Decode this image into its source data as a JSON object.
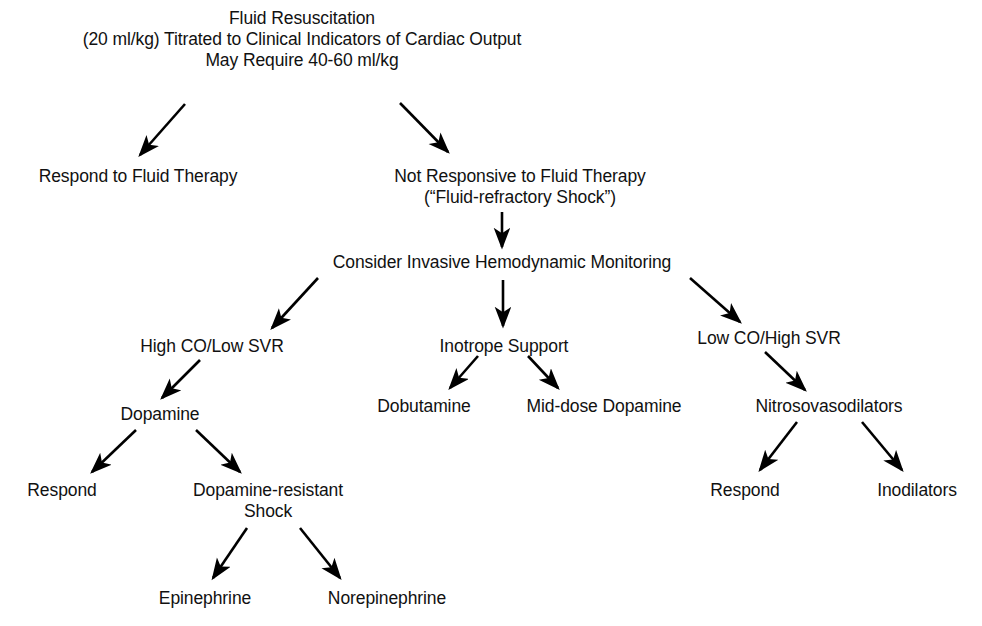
{
  "diagram": {
    "type": "flowchart",
    "orientation": "top-down",
    "background_color": "#ffffff",
    "text_color": "#111111",
    "arrow_color": "#000000",
    "nodes": [
      {
        "id": "fluid-resuscitation",
        "level": 1,
        "lines": [
          "Fluid Resuscitation",
          "(20 ml/kg) Titrated to Clinical Indicators of Cardiac Output",
          "May Require 40-60 ml/kg"
        ],
        "x": 302,
        "y": 8
      },
      {
        "id": "respond-to-fluid-therapy",
        "level": 2,
        "lines": [
          "Respond to Fluid Therapy"
        ],
        "x": 138,
        "y": 166
      },
      {
        "id": "not-responsive-to-fluid-therapy",
        "level": 2,
        "lines": [
          "Not Responsive to Fluid Therapy",
          "(“Fluid-refractory Shock”)"
        ],
        "x": 520,
        "y": 166
      },
      {
        "id": "consider-invasive-hemodynamic-monitoring",
        "level": 3,
        "lines": [
          "Consider Invasive Hemodynamic Monitoring"
        ],
        "x": 502,
        "y": 252
      },
      {
        "id": "high-co-low-svr",
        "level": 4,
        "lines": [
          "High CO/Low SVR"
        ],
        "x": 212,
        "y": 336
      },
      {
        "id": "inotrope-support",
        "level": 4,
        "lines": [
          "Inotrope Support"
        ],
        "x": 504,
        "y": 336
      },
      {
        "id": "low-co-high-svr",
        "level": 4,
        "lines": [
          "Low CO/High SVR"
        ],
        "x": 769,
        "y": 328
      },
      {
        "id": "dopamine",
        "level": 5,
        "lines": [
          "Dopamine"
        ],
        "x": 160,
        "y": 404
      },
      {
        "id": "dobutamine",
        "level": 5,
        "lines": [
          "Dobutamine"
        ],
        "x": 424,
        "y": 396
      },
      {
        "id": "mid-dose-dopamine",
        "level": 5,
        "lines": [
          "Mid-dose Dopamine"
        ],
        "x": 604,
        "y": 396
      },
      {
        "id": "nitrosovasodilators",
        "level": 5,
        "lines": [
          "Nitrosovasodilators"
        ],
        "x": 829,
        "y": 396
      },
      {
        "id": "respond-dopamine",
        "level": 6,
        "lines": [
          "Respond"
        ],
        "x": 62,
        "y": 480
      },
      {
        "id": "dopamine-resistant-shock",
        "level": 6,
        "lines": [
          "Dopamine-resistant",
          "Shock"
        ],
        "x": 268,
        "y": 480
      },
      {
        "id": "respond-nitroso",
        "level": 6,
        "lines": [
          "Respond"
        ],
        "x": 745,
        "y": 480
      },
      {
        "id": "inodilators",
        "level": 6,
        "lines": [
          "Inodilators"
        ],
        "x": 917,
        "y": 480
      },
      {
        "id": "epinephrine",
        "level": 7,
        "lines": [
          "Epinephrine"
        ],
        "x": 205,
        "y": 588
      },
      {
        "id": "norepinephrine",
        "level": 7,
        "lines": [
          "Norepinephrine"
        ],
        "x": 387,
        "y": 588
      }
    ],
    "edges": [
      {
        "id": "edge-fluid-to-respond",
        "from": "fluid-resuscitation",
        "to": "respond-to-fluid-therapy",
        "x1": 185,
        "y1": 104,
        "x2": 140,
        "y2": 155
      },
      {
        "id": "edge-fluid-to-not-responsive",
        "from": "fluid-resuscitation",
        "to": "not-responsive-to-fluid-therapy",
        "x1": 400,
        "y1": 103,
        "x2": 448,
        "y2": 152
      },
      {
        "id": "edge-not-responsive-to-consider",
        "from": "not-responsive-to-fluid-therapy",
        "to": "consider-invasive-hemodynamic-monitoring",
        "x1": 502,
        "y1": 212,
        "x2": 502,
        "y2": 247
      },
      {
        "id": "edge-consider-to-high-co",
        "from": "consider-invasive-hemodynamic-monitoring",
        "to": "high-co-low-svr",
        "x1": 318,
        "y1": 278,
        "x2": 272,
        "y2": 328
      },
      {
        "id": "edge-consider-to-inotrope",
        "from": "consider-invasive-hemodynamic-monitoring",
        "to": "inotrope-support",
        "x1": 503,
        "y1": 280,
        "x2": 503,
        "y2": 326
      },
      {
        "id": "edge-consider-to-low-co",
        "from": "consider-invasive-hemodynamic-monitoring",
        "to": "low-co-high-svr",
        "x1": 690,
        "y1": 278,
        "x2": 740,
        "y2": 322
      },
      {
        "id": "edge-high-co-to-dopamine",
        "from": "high-co-low-svr",
        "to": "dopamine",
        "x1": 200,
        "y1": 360,
        "x2": 162,
        "y2": 398
      },
      {
        "id": "edge-dopamine-to-respond",
        "from": "dopamine",
        "to": "respond-dopamine",
        "x1": 136,
        "y1": 430,
        "x2": 92,
        "y2": 472
      },
      {
        "id": "edge-dopamine-to-resistant",
        "from": "dopamine",
        "to": "dopamine-resistant-shock",
        "x1": 196,
        "y1": 430,
        "x2": 240,
        "y2": 472
      },
      {
        "id": "edge-inotrope-to-dobutamine",
        "from": "inotrope-support",
        "to": "dobutamine",
        "x1": 478,
        "y1": 356,
        "x2": 450,
        "y2": 388
      },
      {
        "id": "edge-inotrope-to-mid-dose",
        "from": "inotrope-support",
        "to": "mid-dose-dopamine",
        "x1": 528,
        "y1": 356,
        "x2": 558,
        "y2": 388
      },
      {
        "id": "edge-low-co-to-nitroso",
        "from": "low-co-high-svr",
        "to": "nitrosovasodilators",
        "x1": 765,
        "y1": 352,
        "x2": 805,
        "y2": 390
      },
      {
        "id": "edge-nitroso-to-respond",
        "from": "nitrosovasodilators",
        "to": "respond-nitroso",
        "x1": 797,
        "y1": 422,
        "x2": 760,
        "y2": 470
      },
      {
        "id": "edge-nitroso-to-inodilators",
        "from": "nitrosovasodilators",
        "to": "inodilators",
        "x1": 862,
        "y1": 422,
        "x2": 902,
        "y2": 470
      },
      {
        "id": "edge-resistant-to-epinephrine",
        "from": "dopamine-resistant-shock",
        "to": "epinephrine",
        "x1": 247,
        "y1": 528,
        "x2": 213,
        "y2": 578
      },
      {
        "id": "edge-resistant-to-norepinephrine",
        "from": "dopamine-resistant-shock",
        "to": "norepinephrine",
        "x1": 300,
        "y1": 528,
        "x2": 340,
        "y2": 578
      }
    ]
  }
}
